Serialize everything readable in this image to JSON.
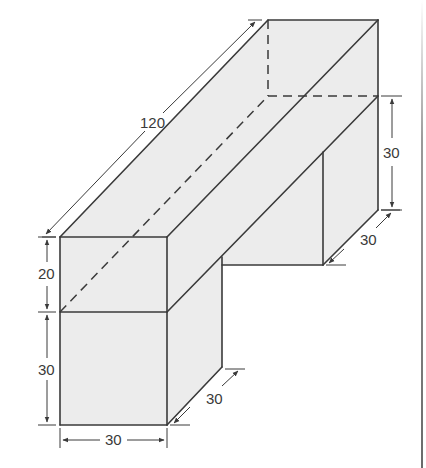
{
  "figure": {
    "type": "isometric-solid",
    "colors": {
      "edge": "#3a3a3a",
      "face": "#ececec",
      "background": "#ffffff"
    }
  },
  "dimensions": {
    "beam_length": "120",
    "beam_height": "20",
    "front_support_height": "30",
    "front_support_width": "30",
    "front_support_depth": "30",
    "back_support_height": "30",
    "back_support_depth": "30"
  }
}
